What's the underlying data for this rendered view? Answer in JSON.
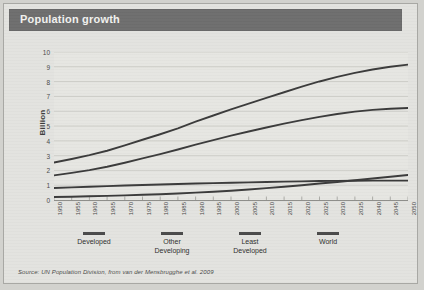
{
  "figure": {
    "title": "Population growth",
    "source": "Source: UN Population Division, from van der Mensbrugghe et al. 2009"
  },
  "legend": [
    {
      "label_line1": "Developed",
      "label_line2": ""
    },
    {
      "label_line1": "Other",
      "label_line2": "Developing"
    },
    {
      "label_line1": "Least",
      "label_line2": "Developed"
    },
    {
      "label_line1": "World",
      "label_line2": ""
    }
  ],
  "colors": {
    "banner": "#6e6e6e",
    "banner_text": "#f2f2f0",
    "paper": "#e3e3df",
    "plot_bg": "#e6e6e2",
    "line": "#3a3a3a",
    "grid": "#c2c2be",
    "axis": "#8d8d89"
  },
  "chart_data": {
    "type": "line",
    "title": "Population growth",
    "xlabel": "",
    "ylabel": "Billion",
    "xlim": [
      1950,
      2050
    ],
    "ylim": [
      0,
      10
    ],
    "grid": true,
    "legend_position": "bottom",
    "yticks": [
      0,
      1,
      2,
      3,
      4,
      5,
      6,
      7,
      8,
      9,
      10
    ],
    "x": [
      1950,
      1955,
      1960,
      1965,
      1970,
      1975,
      1980,
      1985,
      1990,
      1995,
      2000,
      2005,
      2010,
      2015,
      2020,
      2025,
      2030,
      2035,
      2040,
      2045,
      2050
    ],
    "categories": [
      "1950",
      "1955",
      "1960",
      "1965",
      "1970",
      "1975",
      "1980",
      "1985",
      "1990",
      "1995",
      "2000",
      "2005",
      "2010",
      "2015",
      "2020",
      "2025",
      "2030",
      "2035",
      "2040",
      "2045",
      "2050"
    ],
    "series": [
      {
        "name": "World",
        "values": [
          2.53,
          2.77,
          3.03,
          3.33,
          3.69,
          4.07,
          4.44,
          4.84,
          5.29,
          5.71,
          6.12,
          6.51,
          6.9,
          7.28,
          7.66,
          8.01,
          8.32,
          8.59,
          8.82,
          9.0,
          9.15
        ]
      },
      {
        "name": "Other Developing",
        "values": [
          1.66,
          1.83,
          2.02,
          2.25,
          2.52,
          2.81,
          3.1,
          3.41,
          3.74,
          4.05,
          4.35,
          4.63,
          4.9,
          5.16,
          5.4,
          5.62,
          5.81,
          5.97,
          6.09,
          6.17,
          6.22
        ]
      },
      {
        "name": "Developed",
        "values": [
          0.81,
          0.85,
          0.9,
          0.94,
          0.98,
          1.01,
          1.05,
          1.08,
          1.11,
          1.14,
          1.17,
          1.19,
          1.22,
          1.24,
          1.26,
          1.28,
          1.29,
          1.3,
          1.31,
          1.31,
          1.31
        ]
      },
      {
        "name": "Least Developed",
        "values": [
          0.2,
          0.22,
          0.25,
          0.28,
          0.31,
          0.35,
          0.39,
          0.44,
          0.5,
          0.56,
          0.63,
          0.71,
          0.8,
          0.9,
          1.0,
          1.11,
          1.22,
          1.33,
          1.45,
          1.57,
          1.69
        ]
      }
    ]
  }
}
